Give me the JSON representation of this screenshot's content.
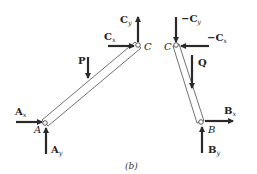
{
  "figure": {
    "caption": "(b)",
    "left_member": {
      "ends": [
        "A",
        "C"
      ],
      "forces": {
        "Ax": {
          "main": "A",
          "sub": "x",
          "direction": "right"
        },
        "Ay": {
          "main": "A",
          "sub": "y",
          "direction": "up"
        },
        "Cx": {
          "main": "C",
          "sub": "x",
          "direction": "right"
        },
        "Cy": {
          "main": "C",
          "sub": "y",
          "direction": "up"
        },
        "P": {
          "main": "P",
          "direction": "down"
        }
      },
      "pin_labels": {
        "A": "A",
        "C": "C"
      }
    },
    "right_member": {
      "ends": [
        "C",
        "B"
      ],
      "forces": {
        "neg_Cx": {
          "sign": "−",
          "main": "C",
          "sub": "x",
          "direction": "left"
        },
        "neg_Cy": {
          "sign": "−",
          "main": "C",
          "sub": "y",
          "direction": "down"
        },
        "Bx": {
          "main": "B",
          "sub": "x",
          "direction": "right"
        },
        "By": {
          "main": "B",
          "sub": "y",
          "direction": "up"
        },
        "Q": {
          "main": "Q",
          "direction": "down"
        }
      },
      "pin_labels": {
        "C": "C",
        "B": "B"
      }
    }
  },
  "colors": {
    "ink": "#222222",
    "arrow": "#2a2a2a",
    "background": "#ffffff"
  }
}
